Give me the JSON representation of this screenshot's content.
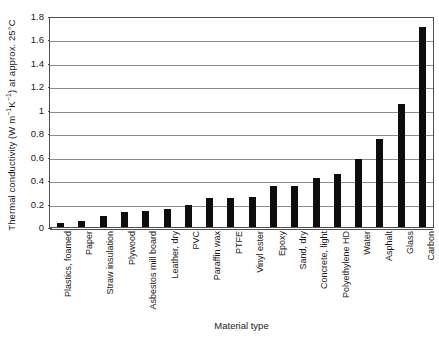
{
  "chart_data": {
    "type": "bar",
    "title": "",
    "xlabel": "Material type",
    "ylabel": "Thermal conductivity (W m⁻¹K⁻¹) at approx. 25°C",
    "ylabel_parts": {
      "pre": "Thermal conductivity (W m",
      "sup1": "−1",
      "mid": "K",
      "sup2": "−1",
      "post": ") at approx. 25°C"
    },
    "ylim": [
      0,
      1.8
    ],
    "ytick_labels": [
      "1.8",
      "1.6",
      "1.4",
      "1.2",
      "1",
      "0.8",
      "0.6",
      "0.4",
      "0.2",
      "0"
    ],
    "ytick_values": [
      1.8,
      1.6,
      1.4,
      1.2,
      1.0,
      0.8,
      0.6,
      0.4,
      0.2,
      0
    ],
    "grid": true,
    "legend": false,
    "bar_color": "#0d0d0d",
    "categories": [
      "Plastics, foamed",
      "Paper",
      "Straw insulation",
      "Plywood",
      "Asbestos mill board",
      "Leather, dry",
      "PVC",
      "Paraffin wax",
      "PTFE",
      "Vinyl ester",
      "Epoxy",
      "Sand, dry",
      "Concrete, light",
      "Polyethylene HD",
      "Water",
      "Asphalt",
      "Glass",
      "Carbon"
    ],
    "values": [
      0.03,
      0.05,
      0.09,
      0.13,
      0.14,
      0.15,
      0.19,
      0.25,
      0.25,
      0.26,
      0.35,
      0.35,
      0.42,
      0.45,
      0.58,
      0.75,
      1.05,
      1.71
    ]
  }
}
